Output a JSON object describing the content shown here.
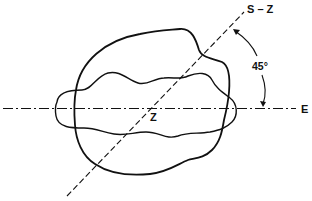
{
  "diagram": {
    "labels": {
      "diagonal_axis": "S – Z",
      "horizontal_axis": "E",
      "center": "Z",
      "angle": "45°"
    },
    "elements": {
      "outer_contour": "large irregular closed curve",
      "inner_contour": "horizontally elongated wavy closed curve",
      "horizontal_axis_style": "dash-dot",
      "diagonal_axis_style": "dashed",
      "angle_indicator": "curved double-headed arrow between axes"
    },
    "colors": {
      "stroke": "#111111",
      "background": "#ffffff"
    }
  }
}
